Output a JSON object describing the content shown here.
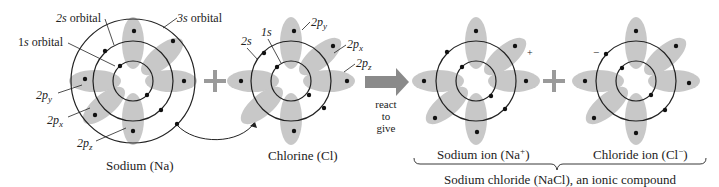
{
  "colors": {
    "lobe": "#c8c8c8",
    "line": "#222222",
    "arrow": "#8a8a8a",
    "plus": "#9a9a9a"
  },
  "sodium": {
    "name": "Sodium (Na)",
    "labels": {
      "s2": "2s orbital",
      "s3": "3s orbital",
      "s1": "1s orbital",
      "py": "2p",
      "py_sub": "y",
      "px": "2p",
      "px_sub": "x",
      "pz": "2p",
      "pz_sub": "z"
    }
  },
  "chlorine": {
    "name": "Chlorine (Cl)",
    "labels": {
      "s1": "1s",
      "s2": "2s",
      "py": "2p",
      "py_sub": "y",
      "px": "2p",
      "px_sub": "x",
      "pz": "2p",
      "pz_sub": "z"
    }
  },
  "plus_sign": "+",
  "reaction": {
    "line1": "react",
    "line2": "to",
    "line3": "give"
  },
  "sodium_ion": {
    "name": "Sodium ion (Na",
    "sup": "+",
    "close": ")",
    "charge": "+"
  },
  "chloride_ion": {
    "name": "Chloride ion (Cl",
    "sup": "−",
    "close": ")",
    "charge": "−"
  },
  "compound": "Sodium chloride (NaCl), an ionic compound"
}
